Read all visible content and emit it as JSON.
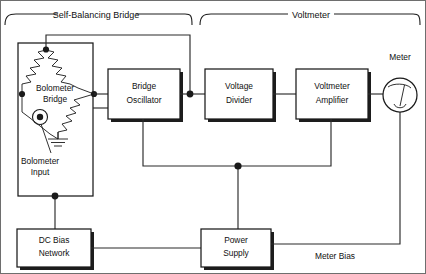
{
  "figure": {
    "kind": "block-diagram",
    "title_braces": [
      {
        "id": "self-balancing-bridge",
        "label": "Self-Balancing Bridge",
        "x1": 5,
        "x2": 192,
        "text_x": 96,
        "text_y": 15
      },
      {
        "id": "voltmeter",
        "label": "Voltmeter",
        "x1": 200,
        "x2": 420,
        "text_x": 311,
        "text_y": 15
      }
    ],
    "blocks": [
      {
        "id": "bridge-oscillator",
        "lines": [
          "Bridge",
          "Oscillator"
        ],
        "x": 108,
        "y": 69,
        "w": 72,
        "h": 50
      },
      {
        "id": "voltage-divider",
        "lines": [
          "Voltage",
          "Divider"
        ],
        "x": 205,
        "y": 69,
        "w": 68,
        "h": 50
      },
      {
        "id": "voltmeter-amplifier",
        "lines": [
          "Voltmeter",
          "Amplifier"
        ],
        "x": 296,
        "y": 69,
        "w": 72,
        "h": 50
      },
      {
        "id": "dc-bias-network",
        "lines": [
          "DC Bias",
          "Network"
        ],
        "x": 17,
        "y": 229,
        "w": 74,
        "h": 38
      },
      {
        "id": "power-supply",
        "lines": [
          "Power",
          "Supply"
        ],
        "x": 201,
        "y": 229,
        "w": 70,
        "h": 38
      },
      {
        "id": "bolometer-enclosure",
        "lines": [],
        "x": 18,
        "y": 43,
        "w": 75,
        "h": 153
      }
    ],
    "component_labels": [
      {
        "id": "bolometer-bridge",
        "lines": [
          "Bolometer",
          "Bridge"
        ],
        "x": 55,
        "y": 93
      },
      {
        "id": "bolometer-input",
        "lines": [
          "Bolometer",
          "Input"
        ],
        "x": 40,
        "y": 166
      },
      {
        "id": "meter",
        "lines": [
          "Meter"
        ],
        "x": 400,
        "y": 62
      },
      {
        "id": "meter-bias",
        "lines": [
          "Meter Bias"
        ],
        "x": 335,
        "y": 259
      }
    ],
    "meter_symbol": {
      "id": "meter-gauge",
      "cx": 400,
      "cy": 95,
      "r": 17
    },
    "colors": {
      "ink": "#1a1a1a",
      "wire": "#2a2a2a",
      "paper": "#ffffff",
      "frame": "#6e6e6e"
    }
  }
}
